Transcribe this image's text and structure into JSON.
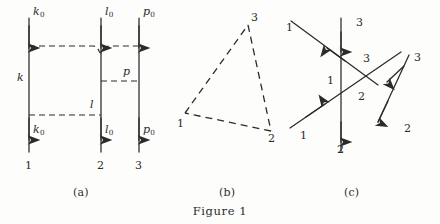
{
  "figure": {
    "caption": "Figure 1",
    "background_color": "#fdfdfb",
    "ink_color": "#2b2b2b",
    "panels": [
      {
        "id": "a",
        "label": "(a)"
      },
      {
        "id": "b",
        "label": "(b)"
      },
      {
        "id": "c",
        "label": "(c)"
      }
    ]
  },
  "panel_a": {
    "name": "three-world-lines-with-dashed-interactions",
    "lines": [
      {
        "id": "line-1",
        "bottom_label": "1",
        "top_momentum": "k",
        "top_momentum_sub": "0",
        "mid_momentum": "k",
        "bottom_momentum": "k",
        "bottom_momentum_sub": "0"
      },
      {
        "id": "line-2",
        "bottom_label": "2",
        "top_momentum": "l",
        "top_momentum_sub": "0",
        "mid_momentum": "l",
        "bottom_momentum": "l",
        "bottom_momentum_sub": "0"
      },
      {
        "id": "line-3",
        "bottom_label": "3",
        "top_momentum": "p",
        "top_momentum_sub": "0",
        "mid_momentum": "p",
        "bottom_momentum": "p",
        "bottom_momentum_sub": "0"
      }
    ],
    "labels": {
      "top_k0": "k",
      "top_k0_sub": "0",
      "top_l0": "l",
      "top_l0_sub": "0",
      "top_p0": "p",
      "top_p0_sub": "0",
      "mid_k": "k",
      "mid_l": "l",
      "mid_p": "p",
      "bot_k0": "k",
      "bot_k0_sub": "0",
      "bot_l0": "l",
      "bot_l0_sub": "0",
      "bot_p0": "p",
      "bot_p0_sub": "0",
      "num_1": "1",
      "num_2": "2",
      "num_3": "3"
    }
  },
  "panel_b": {
    "name": "dashed-triangle",
    "vertices": [
      {
        "id": "v1",
        "label": "1",
        "x": 185,
        "y": 113
      },
      {
        "id": "v2",
        "label": "2",
        "x": 271,
        "y": 131
      },
      {
        "id": "v3",
        "label": "3",
        "x": 248,
        "y": 25
      }
    ]
  },
  "panel_c": {
    "name": "three-crossing-directed-lines",
    "labels": {
      "line1_start": "1",
      "line1_mid": "1",
      "line1_end": "1",
      "line2_bottom": "2",
      "line2_mid": "2",
      "line2_end": "2",
      "line3_top": "3",
      "line3_mid": "3",
      "line3_end": "3"
    }
  }
}
